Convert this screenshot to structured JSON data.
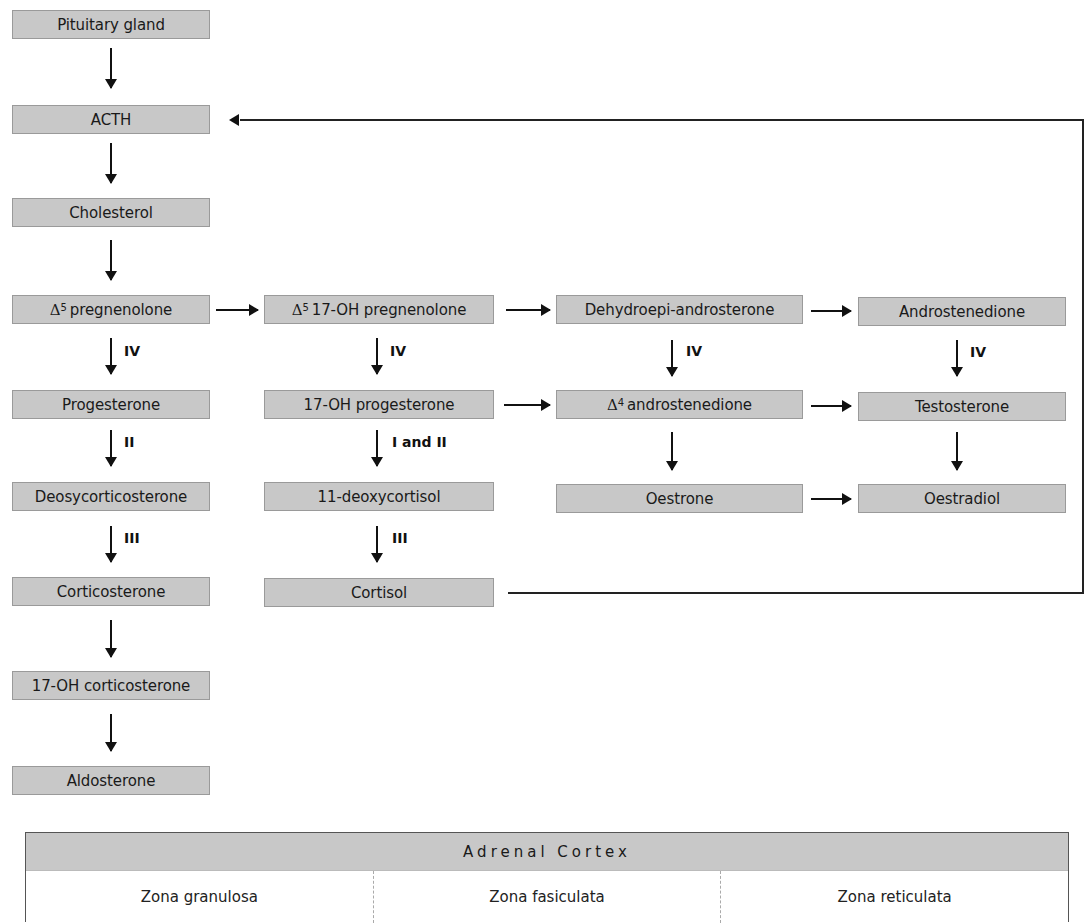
{
  "diagram": {
    "type": "flowchart",
    "nodes": {
      "pituitary": "Pituitary gland",
      "acth": "ACTH",
      "cholesterol": "Cholesterol",
      "preg": {
        "prefix": "Δ",
        "sup": "5",
        "label": "pregnenolone"
      },
      "oh_preg": {
        "prefix": "Δ",
        "sup": "5",
        "label": "17-OH pregnenolone"
      },
      "dhea": "Dehydroepi-androsterone",
      "androstenedione": "Androstenedione",
      "progesterone": "Progesterone",
      "oh_progesterone": "17-OH progesterone",
      "d4_andro": {
        "prefix": "Δ",
        "sup": "4",
        "label": "androstenedione"
      },
      "testosterone": "Testosterone",
      "doc": "Deosycorticosterone",
      "deoxycortisol": "11-deoxycortisol",
      "oestrone": "Oestrone",
      "oestradiol": "Oestradiol",
      "corticosterone": "Corticosterone",
      "cortisol": "Cortisol",
      "oh_corticosterone": "17-OH corticosterone",
      "aldosterone": "Aldosterone"
    },
    "enzymes": {
      "preg_to_prog": "IV",
      "ohpreg_to_ohprog": "IV",
      "dhea_to_d4": "IV",
      "andro_to_testo": "IV",
      "prog_to_doc": "II",
      "ohprog_to_deoxycortisol": "I and II",
      "doc_to_cortico": "III",
      "deoxycortisol_to_cortisol": "III"
    },
    "edges": [
      [
        "Pituitary gland",
        "ACTH"
      ],
      [
        "ACTH",
        "Cholesterol"
      ],
      [
        "Cholesterol",
        "Δ5 pregnenolone"
      ],
      [
        "Δ5 pregnenolone",
        "Δ5 17-OH pregnenolone"
      ],
      [
        "Δ5 17-OH pregnenolone",
        "Dehydroepi-androsterone"
      ],
      [
        "Dehydroepi-androsterone",
        "Androstenedione"
      ],
      [
        "Δ5 pregnenolone",
        "Progesterone",
        "IV"
      ],
      [
        "Δ5 17-OH pregnenolone",
        "17-OH progesterone",
        "IV"
      ],
      [
        "Dehydroepi-androsterone",
        "Δ4 androstenedione",
        "IV"
      ],
      [
        "Androstenedione",
        "Testosterone",
        "IV"
      ],
      [
        "17-OH progesterone",
        "Δ4 androstenedione"
      ],
      [
        "Δ4 androstenedione",
        "Testosterone"
      ],
      [
        "Progesterone",
        "Deosycorticosterone",
        "II"
      ],
      [
        "17-OH progesterone",
        "11-deoxycortisol",
        "I and II"
      ],
      [
        "Δ4 androstenedione",
        "Oestrone"
      ],
      [
        "Testosterone",
        "Oestradiol"
      ],
      [
        "Oestrone",
        "Oestradiol"
      ],
      [
        "Deosycorticosterone",
        "Corticosterone",
        "III"
      ],
      [
        "11-deoxycortisol",
        "Cortisol",
        "III"
      ],
      [
        "Corticosterone",
        "17-OH corticosterone"
      ],
      [
        "17-OH corticosterone",
        "Aldosterone"
      ],
      [
        "Cortisol",
        "ACTH",
        "feedback"
      ]
    ]
  },
  "cortex": {
    "title": "Adrenal Cortex",
    "zones": [
      "Zona granulosa",
      "Zona fasiculata",
      "Zona reticulata"
    ]
  }
}
